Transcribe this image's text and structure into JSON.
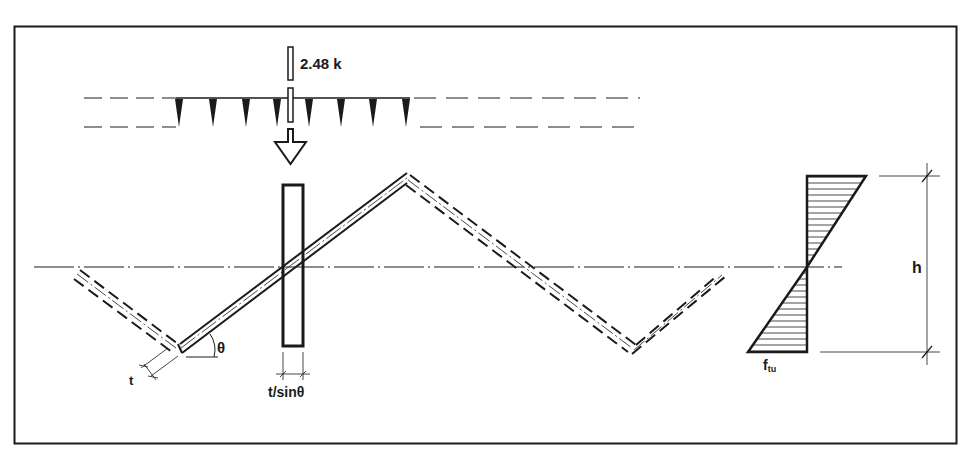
{
  "diagram": {
    "type": "structural-section",
    "colors": {
      "ink": "#1a1a1a",
      "background": "#ffffff"
    },
    "frame": {
      "x": 14,
      "y": 26,
      "width": 942,
      "height": 417
    },
    "labels": {
      "load": "2.48 k",
      "angle": "θ",
      "thickness": "t",
      "effective_width": "t/sinθ",
      "stress_main": "f",
      "stress_sub": "tu",
      "depth": "h"
    },
    "load": {
      "value": 2.48,
      "unit": "k",
      "x": 290
    },
    "stress_diagram": {
      "axis_x": 807,
      "top_y": 176,
      "bottom_y": 352,
      "neutral_y": 267,
      "top_extent_x": 866,
      "bottom_extent_x": 748
    },
    "zigzag_points": [
      [
        75,
        272
      ],
      [
        180,
        350
      ],
      [
        407,
        178
      ],
      [
        632,
        350
      ],
      [
        720,
        270
      ]
    ],
    "rectangle": {
      "x": 283,
      "y": 185,
      "width": 20,
      "height": 161
    }
  }
}
